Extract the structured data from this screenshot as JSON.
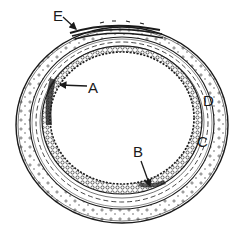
{
  "figure": {
    "colors": {
      "ink": "#1a1a1a",
      "background": "#ffffff"
    },
    "labels": [
      {
        "id": "E",
        "text": "E",
        "x": 53,
        "y": 21,
        "pointer": {
          "x1": 63,
          "y1": 17,
          "x2": 76,
          "y2": 29
        }
      },
      {
        "id": "A",
        "text": "A",
        "x": 88,
        "y": 93,
        "pointer": {
          "x1": 87,
          "y1": 86,
          "x2": 60,
          "y2": 85
        }
      },
      {
        "id": "D",
        "text": "D",
        "x": 203,
        "y": 106,
        "pointer": null
      },
      {
        "id": "C",
        "text": "C",
        "x": 197,
        "y": 147,
        "pointer": null
      },
      {
        "id": "B",
        "text": "B",
        "x": 133,
        "y": 157,
        "pointer": {
          "x1": 141,
          "y1": 161,
          "x2": 150,
          "y2": 186
        }
      }
    ]
  }
}
